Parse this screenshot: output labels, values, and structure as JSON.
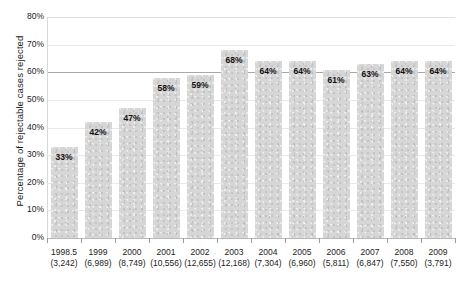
{
  "chart_data": {
    "type": "bar",
    "title": "",
    "xlabel": "",
    "ylabel": "Percentage of rejectable cases rejected",
    "ylim": [
      0,
      80
    ],
    "grid": true,
    "legend": "none",
    "orientation": "vertical",
    "bar_color": "#d6d6d6",
    "emphasis_gridline": 60,
    "categories": [
      "1998.5",
      "1999",
      "2000",
      "2001",
      "2002",
      "2003",
      "2004",
      "2005",
      "2006",
      "2007",
      "2008",
      "2009"
    ],
    "category_counts": [
      "(3,242)",
      "(6,989)",
      "(8,749)",
      "(10,556)",
      "(12,655)",
      "(12,168)",
      "(7,304)",
      "(6,960)",
      "(5,811)",
      "(6,847)",
      "(7,550)",
      "(3,791)"
    ],
    "values": [
      33,
      42,
      47,
      58,
      59,
      68,
      64,
      64,
      61,
      63,
      64,
      64
    ],
    "value_labels": [
      "33%",
      "42%",
      "47%",
      "58%",
      "59%",
      "68%",
      "64%",
      "64%",
      "61%",
      "63%",
      "64%",
      "64%"
    ],
    "y_ticks": [
      0,
      10,
      20,
      30,
      40,
      50,
      60,
      70,
      80
    ],
    "y_tick_labels": [
      "0%",
      "10%",
      "20%",
      "30%",
      "40%",
      "50%",
      "60%",
      "70%",
      "80%"
    ]
  }
}
